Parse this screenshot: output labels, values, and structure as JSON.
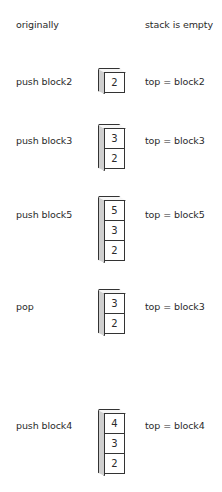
{
  "rows": [
    {
      "action": "originally",
      "state": "stack is empty",
      "blocks": []
    },
    {
      "action": "push block2",
      "state": "top = block2",
      "blocks": [
        "2"
      ]
    },
    {
      "action": "push block3",
      "state": "top = block3",
      "blocks": [
        "3",
        "2"
      ]
    },
    {
      "action": "push block5",
      "state": "top = block5",
      "blocks": [
        "5",
        "3",
        "2"
      ]
    },
    {
      "action": "pop",
      "state": "top = block3",
      "blocks": [
        "3",
        "2"
      ]
    },
    {
      "action": "push block4",
      "state": "top = block4",
      "blocks": [
        "4",
        "3",
        "2"
      ]
    }
  ],
  "colors": {
    "outline": "#333333",
    "side_face": "#cfcfcf",
    "front_face": "#ffffff",
    "text": "#2a2a2a"
  }
}
